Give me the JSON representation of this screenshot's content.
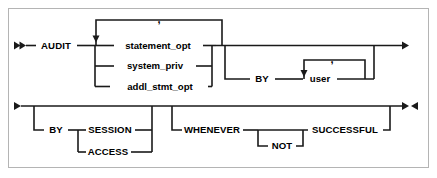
{
  "diagram": {
    "type": "railroad-syntax-diagram",
    "colors": {
      "line": "#1a1a1a",
      "border": "#b4b4b4",
      "background": "#ffffff",
      "text": "#000000"
    },
    "rows": [
      {
        "id": "row-1",
        "start_marker": "double-right-arrow",
        "end_marker": "right-arrow"
      },
      {
        "id": "row-2",
        "start_marker": "right-arrow",
        "end_marker": "right-left-arrow"
      }
    ],
    "tokens": {
      "audit": "AUDIT",
      "statement_opt": "statement_opt",
      "system_priv": "system_priv",
      "addl_stmt_opt": "addl_stmt_opt",
      "comma_top": ",",
      "by_user": "BY",
      "user": "user",
      "comma_user": ",",
      "by_mode": "BY",
      "session": "SESSION",
      "access": "ACCESS",
      "whenever": "WHENEVER",
      "not": "NOT",
      "successful": "SUCCESSFUL"
    }
  }
}
